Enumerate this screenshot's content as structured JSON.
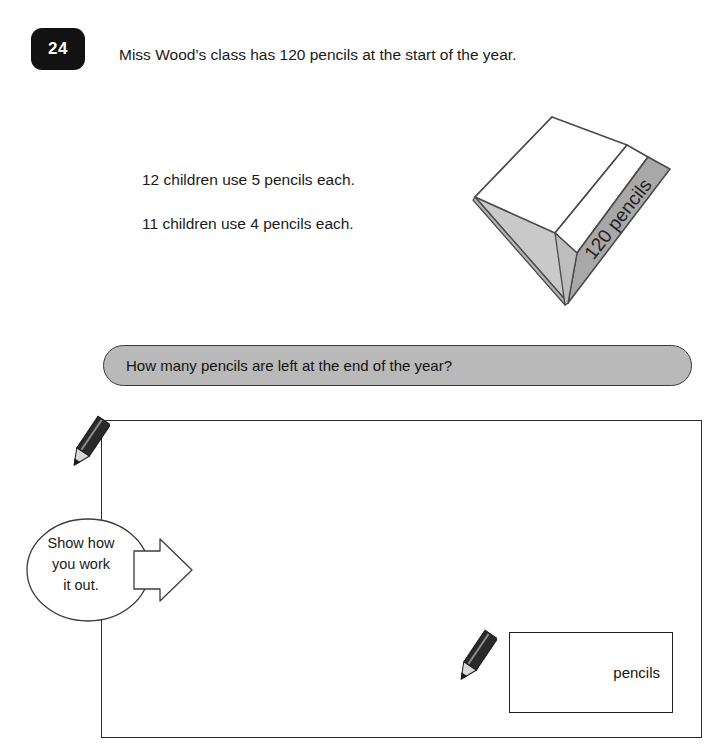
{
  "question": {
    "number": "24",
    "stem": "Miss Wood’s class has 120 pencils at the start of the year.",
    "statements": [
      "12 children use 5 pencils each.",
      "11 children use 4 pencils each."
    ],
    "prompt": "How many pencils are left at the end of the year?"
  },
  "illustration": {
    "label": "120 pencils",
    "top_face_color": "#ffffff",
    "left_face_color": "#c9c9c9",
    "right_face_color": "#a8a8a8",
    "outline_color": "#4a4a4a"
  },
  "banner": {
    "fill_color": "#b9b9b9",
    "border_color": "#3a3a3a"
  },
  "working_area": {
    "instruction_line_1": "Show how",
    "instruction_line_2": "you work",
    "instruction_line_3": "it out.",
    "border_color": "#2b2b2b"
  },
  "answer": {
    "value": "",
    "unit_label": "pencils",
    "border_color": "#1f1f1f"
  },
  "icons": {
    "pencil_body_color": "#2a2a2a",
    "pencil_tip_color": "#d8d8d8"
  }
}
